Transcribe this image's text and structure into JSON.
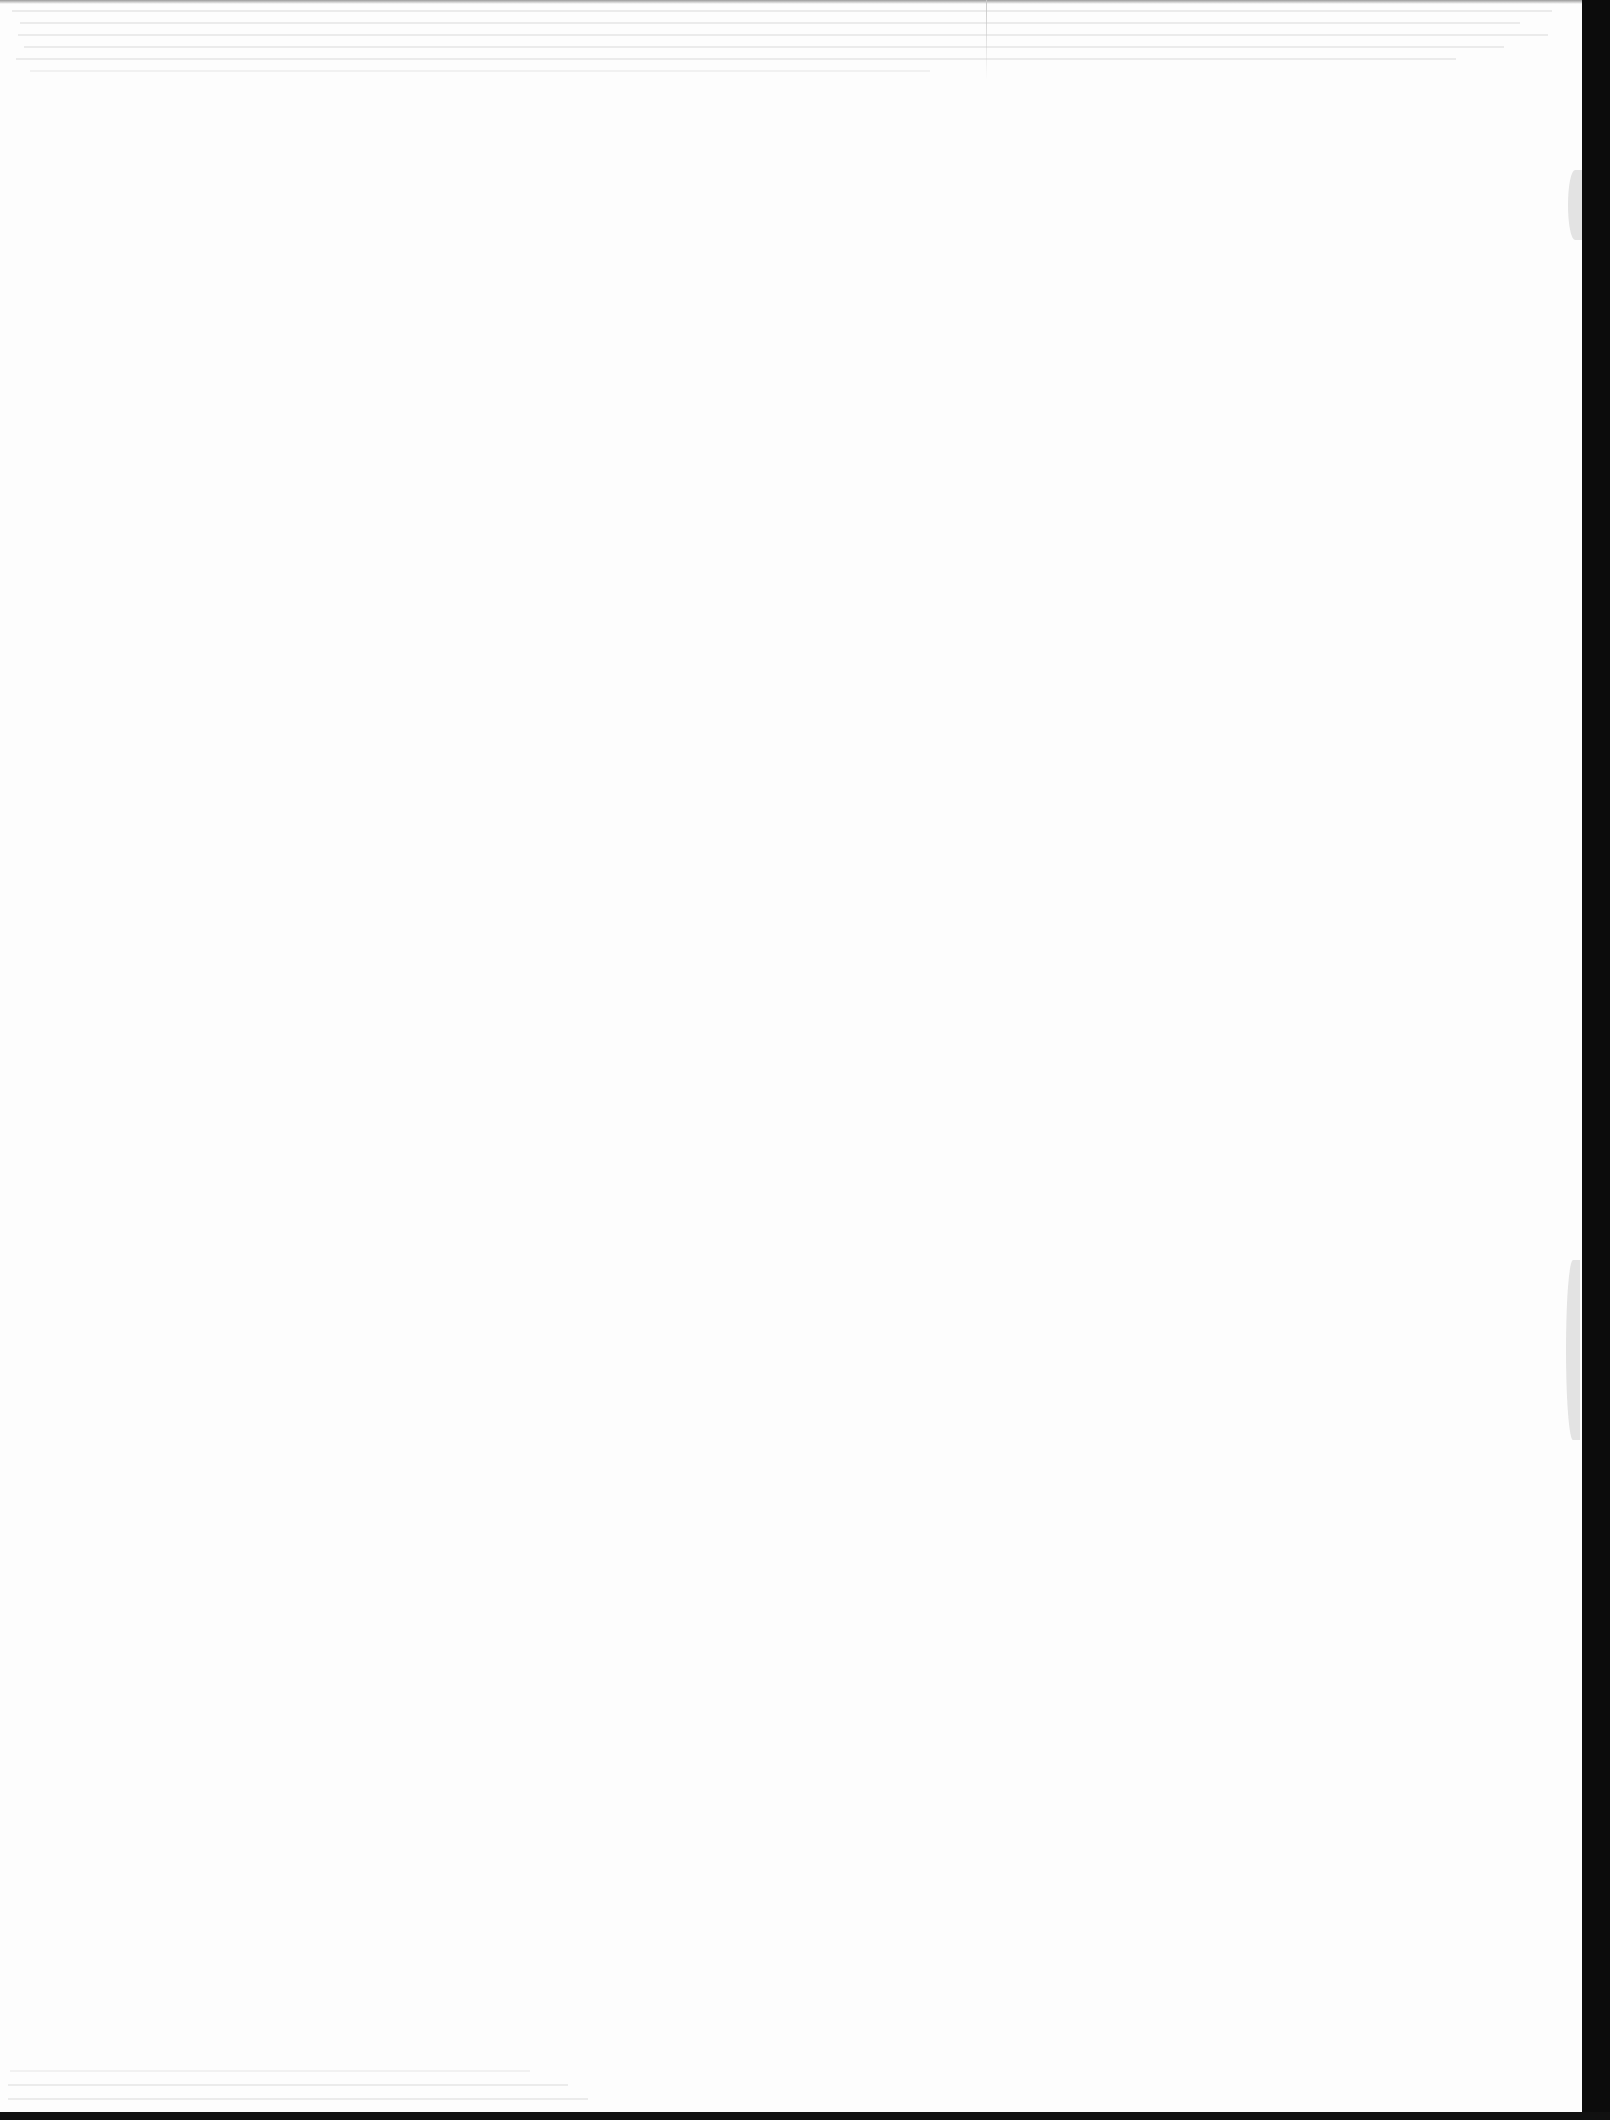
{
  "document": {
    "page_type": "blank scanned page",
    "text_content": "",
    "artifacts": {
      "bleed_through_top_lines": 6,
      "bleed_through_bottom_lines": 3,
      "right_scan_edge_color": "#0c0c0c",
      "page_color": "#fdfdfd"
    }
  }
}
